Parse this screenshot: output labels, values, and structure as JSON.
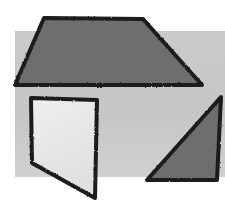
{
  "image": {
    "width": 225,
    "height": 218,
    "page_background": "#ffffff",
    "description": "Scanned line-drawing of three hand-outlined quadrilateral shapes over a light gray panel"
  },
  "panel": {
    "name": "background-panel",
    "fill": "#c9c9c9",
    "x": 15,
    "y": 31,
    "width": 210,
    "height": 146
  },
  "top_artifact": {
    "visible": true,
    "ghost_text": "...... .. ... ..... ... ..... .. ..  ... ..",
    "color": "#d8d8dc"
  },
  "stroke": {
    "color": "#1a1a1a",
    "width": 4
  },
  "shapes": [
    {
      "id": "trapezoid-top",
      "label": "large dark trapezoid",
      "fill": "#6e6e6e",
      "stroke": "#1a1a1a",
      "stroke_width": 4,
      "points": "44,18 143,19 202,85 15,85"
    },
    {
      "id": "quadrilateral-light",
      "label": "light quadrilateral",
      "fill": "#e8e8e8",
      "stroke": "#1a1a1a",
      "stroke_width": 4,
      "points": "31,98 97,100 95,198 32,163"
    },
    {
      "id": "triangle-right",
      "label": "dark right triangle",
      "fill": "#6e6e6e",
      "stroke": "#1a1a1a",
      "stroke_width": 4,
      "points": "221,97 217,180 147,180"
    }
  ]
}
